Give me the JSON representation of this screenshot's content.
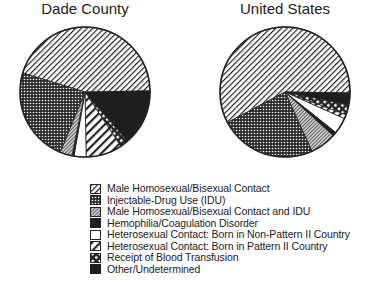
{
  "chart_data": [
    {
      "type": "pie",
      "title": "Dade County",
      "categories": [
        "Male Homosexual/Bisexual Contact",
        "Other/Undetermined",
        "Receipt of Blood Transfusion",
        "Heterosexual Contact: Born in Pattern II Country",
        "Heterosexual Contact: Born in Non-Pattern II Country",
        "Hemophilia/Coagulation Disorder",
        "Male Homosexual/Bisexual Contact and IDU",
        "Injectable-Drug Use (IDU)"
      ],
      "values": [
        45,
        14,
        2,
        9,
        3,
        0.5,
        3,
        23.5
      ],
      "start_angle_deg": 287,
      "direction": "clockwise"
    },
    {
      "type": "pie",
      "title": "United States",
      "categories": [
        "Male Homosexual/Bisexual Contact",
        "Other/Undetermined",
        "Receipt of Blood Transfusion",
        "Heterosexual Contact: Born in Pattern II Country",
        "Heterosexual Contact: Born in Non-Pattern II Country",
        "Hemophilia/Coagulation Disorder",
        "Male Homosexual/Bisexual Contact and IDU",
        "Injectable-Drug Use (IDU)"
      ],
      "values": [
        58,
        3,
        2.5,
        1,
        4,
        1,
        6.5,
        24
      ],
      "start_angle_deg": 242,
      "direction": "clockwise"
    }
  ],
  "titles": {
    "left": "Dade County",
    "right": "United States"
  },
  "legend": [
    {
      "label": "Male Homosexual/Bisexual Contact",
      "pattern": "diag-fine"
    },
    {
      "label": "Injectable-Drug Use (IDU)",
      "pattern": "dots"
    },
    {
      "label": "Male Homosexual/Bisexual Contact and IDU",
      "pattern": "gray-hatch"
    },
    {
      "label": "Hemophilia/Coagulation Disorder",
      "pattern": "solid-dark"
    },
    {
      "label": "Heterosexual Contact: Born in Non-Pattern II Country",
      "pattern": "white"
    },
    {
      "label": "Heterosexual Contact: Born in Pattern II Country",
      "pattern": "diag-wide"
    },
    {
      "label": "Receipt of Blood Transfusion",
      "pattern": "diag-bold"
    },
    {
      "label": "Other/Undetermined",
      "pattern": "solid-dark"
    }
  ]
}
